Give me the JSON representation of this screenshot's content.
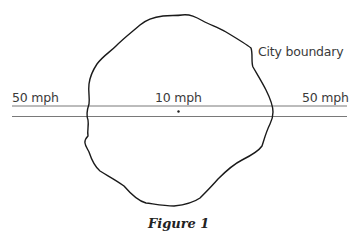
{
  "figure": {
    "caption": "Figure 1",
    "boundary_label": "City boundary",
    "road": {
      "left_label": "50 mph",
      "center_label": "10 mph",
      "right_label": "50 mph"
    },
    "colors": {
      "boundary_stroke": "#1a1a1a",
      "road_stroke": "#555555",
      "text": "#3a3a3a"
    }
  }
}
